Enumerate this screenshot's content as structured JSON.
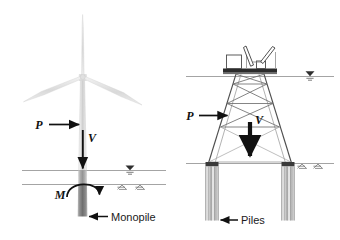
{
  "figure": {
    "background_color": "#ffffff",
    "line_color": "#5a5a5a",
    "dark_color": "#1a1a1a",
    "panels": [
      {
        "id": "left",
        "name": "monopile-panel",
        "structure": "wind-turbine-on-monopile"
      },
      {
        "id": "right",
        "name": "jacket-panel",
        "structure": "platform-on-piled-jacket"
      }
    ]
  },
  "left_panel": {
    "name": "monopile-foundation-diagram",
    "turbine": {
      "name": "wind-turbine",
      "blade_count": 3,
      "tower_color": "#d4d4d4"
    },
    "labels": {
      "lateral_load": "P",
      "vertical_load": "V",
      "moment": "M",
      "foundation": "Monopile"
    },
    "levels": {
      "water_line_name": "water-level-line",
      "mudline_name": "mudline",
      "water_symbol": "water-surface-symbol",
      "soil_symbol": "soil-hatch-symbol"
    },
    "pile_color": "#8e8e8e"
  },
  "right_panel": {
    "name": "jacket-foundation-diagram",
    "topside": {
      "name": "platform-topside",
      "deck_color": "#2b2b2b",
      "module_count": 2,
      "crane_count": 2
    },
    "jacket": {
      "name": "jacket-truss",
      "bays": 3,
      "bracing": "X-bracing",
      "leg_count": 4
    },
    "labels": {
      "lateral_load": "P",
      "vertical_load": "V",
      "foundation": "Piles"
    },
    "levels": {
      "water_line_name": "water-level-line",
      "mudline_name": "mudline",
      "water_symbol": "water-surface-symbol",
      "soil_symbol": "soil-hatch-symbol"
    },
    "pile_group_count": 2,
    "pile_color": "#a0a0a0",
    "pile_cap_color": "#3a3a3a"
  }
}
